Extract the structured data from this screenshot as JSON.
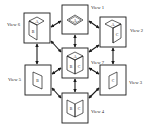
{
  "diagram": {
    "type": "view-transition-diagram",
    "colors": {
      "stroke": "#1a1a1a",
      "background": "#ffffff"
    },
    "views": [
      {
        "id": "view1",
        "label": "View 1",
        "faces": [
          "A"
        ],
        "orientation": "top"
      },
      {
        "id": "view2",
        "label": "View 2",
        "faces": [
          "A",
          "C"
        ],
        "orientation": "top-right"
      },
      {
        "id": "view3",
        "label": "View 3",
        "faces": [
          "C"
        ],
        "orientation": "right"
      },
      {
        "id": "view4",
        "label": "View 4",
        "faces": [
          "B",
          "C"
        ],
        "orientation": "front-open"
      },
      {
        "id": "view5",
        "label": "View 5",
        "faces": [
          "B"
        ],
        "orientation": "left"
      },
      {
        "id": "view6",
        "label": "View 6",
        "faces": [
          "A",
          "B"
        ],
        "orientation": "top-left"
      },
      {
        "id": "view7",
        "label": "View 7",
        "faces": [
          "A",
          "B",
          "C"
        ],
        "orientation": "isometric"
      }
    ],
    "edges": [
      [
        "view6",
        "view1"
      ],
      [
        "view1",
        "view2"
      ],
      [
        "view1",
        "view7"
      ],
      [
        "view6",
        "view7"
      ],
      [
        "view2",
        "view7"
      ],
      [
        "view6",
        "view5"
      ],
      [
        "view2",
        "view3"
      ],
      [
        "view5",
        "view7"
      ],
      [
        "view3",
        "view7"
      ],
      [
        "view5",
        "view4"
      ],
      [
        "view3",
        "view4"
      ],
      [
        "view7",
        "view4"
      ]
    ]
  }
}
